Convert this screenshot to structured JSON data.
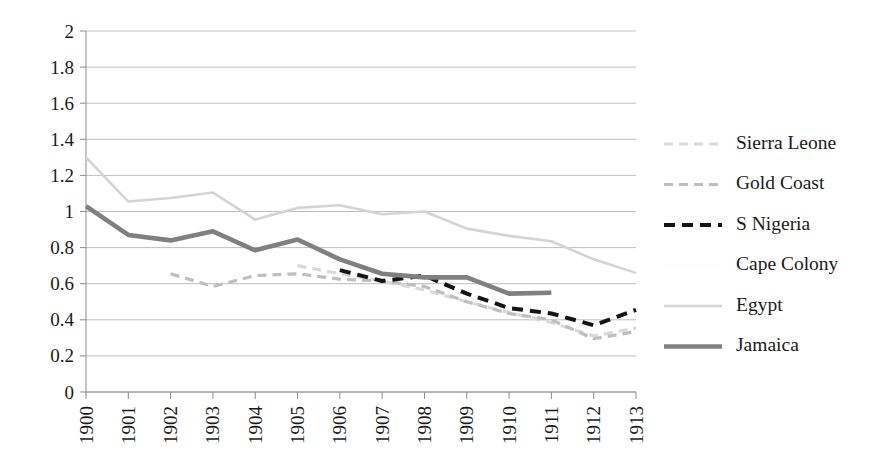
{
  "chart_data": {
    "type": "line",
    "title": "",
    "subtitle": "",
    "xlabel": "",
    "ylabel": "",
    "x": [
      1900,
      1901,
      1902,
      1903,
      1904,
      1905,
      1906,
      1907,
      1908,
      1909,
      1910,
      1911,
      1912,
      1913
    ],
    "xtick_labels": [
      "1900",
      "1901",
      "1902",
      "1903",
      "1904",
      "1905",
      "1906",
      "1907",
      "1908",
      "1909",
      "1910",
      "1911",
      "1912",
      "1913"
    ],
    "ytick_labels": [
      "0",
      "0.2",
      "0.4",
      "0.6",
      "0.8",
      "1",
      "1.2",
      "1.4",
      "1.6",
      "1.8",
      "2"
    ],
    "ytick_values": [
      0,
      0.2,
      0.4,
      0.6,
      0.8,
      1,
      1.2,
      1.4,
      1.6,
      1.8,
      2
    ],
    "ylim": [
      0,
      2
    ],
    "xlim": [
      1900,
      1913
    ],
    "grid": true,
    "grid_axis": "y",
    "legend_position": "right",
    "series": [
      {
        "name": "Sierra Leone",
        "color": "#d9d9d9",
        "style": "dashed",
        "width": 3.2,
        "dash": "9,6",
        "x": [
          1905,
          1906,
          1907,
          1908,
          1909,
          1910,
          1911,
          1912,
          1913
        ],
        "values": [
          0.7,
          0.655,
          0.615,
          0.565,
          0.5,
          0.44,
          0.385,
          0.31,
          0.355
        ]
      },
      {
        "name": "Gold Coast",
        "color": "#bfbfbf",
        "style": "dashed",
        "width": 3.2,
        "dash": "9,6",
        "x": [
          1902,
          1903,
          1904,
          1905,
          1906,
          1907,
          1908,
          1909,
          1910,
          1911,
          1912,
          1913
        ],
        "values": [
          0.655,
          0.585,
          0.645,
          0.655,
          0.625,
          0.615,
          0.585,
          0.5,
          0.435,
          0.4,
          0.295,
          0.335
        ]
      },
      {
        "name": "S Nigeria",
        "color": "#141414",
        "style": "dashed",
        "width": 4.0,
        "dash": "11,7",
        "x": [
          1906,
          1907,
          1908,
          1909,
          1910,
          1911,
          1912,
          1913
        ],
        "values": [
          0.675,
          0.615,
          0.645,
          0.545,
          0.465,
          0.435,
          0.37,
          0.455
        ]
      },
      {
        "name": "Cape Colony",
        "color": "#fdfdfd",
        "style": "solid",
        "width": 2.4,
        "dash": "",
        "x": [],
        "values": []
      },
      {
        "name": "Egypt",
        "color": "#d4d4d4",
        "style": "solid",
        "width": 2.6,
        "dash": "",
        "x": [
          1900,
          1901,
          1902,
          1903,
          1904,
          1905,
          1906,
          1907,
          1908,
          1909,
          1910,
          1911,
          1912,
          1913
        ],
        "values": [
          1.3,
          1.055,
          1.075,
          1.105,
          0.955,
          1.02,
          1.035,
          0.985,
          1.0,
          0.905,
          0.865,
          0.835,
          0.735,
          0.66
        ]
      },
      {
        "name": "Jamaica",
        "color": "#808080",
        "style": "solid",
        "width": 4.6,
        "dash": "",
        "x": [
          1900,
          1901,
          1902,
          1903,
          1904,
          1905,
          1906,
          1907,
          1908,
          1909,
          1910,
          1911
        ],
        "values": [
          1.03,
          0.87,
          0.84,
          0.89,
          0.785,
          0.845,
          0.735,
          0.655,
          0.635,
          0.635,
          0.545,
          0.55
        ]
      }
    ]
  },
  "legend": {
    "entries": [
      {
        "label": "Sierra Leone"
      },
      {
        "label": "Gold Coast"
      },
      {
        "label": "S Nigeria"
      },
      {
        "label": "Cape Colony"
      },
      {
        "label": "Egypt"
      },
      {
        "label": "Jamaica"
      }
    ]
  }
}
